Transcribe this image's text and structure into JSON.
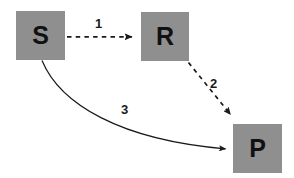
{
  "diagram": {
    "type": "reaction-scheme",
    "background_color": "#ffffff",
    "node_fill_color": "#8f8f8f",
    "node_text_color": "#111111",
    "edge_color": "#1a1a1a",
    "nodes": [
      {
        "id": "s",
        "label": "S",
        "x": 16,
        "y": 11,
        "w": 49,
        "h": 49
      },
      {
        "id": "r",
        "label": "R",
        "x": 141,
        "y": 12,
        "w": 48,
        "h": 49
      },
      {
        "id": "p",
        "label": "P",
        "x": 233,
        "y": 124,
        "w": 49,
        "h": 49
      }
    ],
    "edges": [
      {
        "id": "edge1",
        "label": "1",
        "from": "s",
        "to": "r",
        "style": "dashed",
        "shape": "straight",
        "label_x": 95,
        "label_y": 17
      },
      {
        "id": "edge2",
        "label": "2",
        "from": "r",
        "to": "p",
        "style": "dashed",
        "shape": "straight",
        "label_x": 210,
        "label_y": 77
      },
      {
        "id": "edge3",
        "label": "3",
        "from": "s",
        "to": "p",
        "style": "solid",
        "shape": "curved",
        "label_x": 121,
        "label_y": 103
      }
    ]
  }
}
